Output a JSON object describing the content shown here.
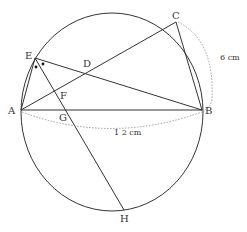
{
  "diagram": {
    "type": "geometry",
    "colors": {
      "stroke": "#333333",
      "dotted": "#777777",
      "background": "#ffffff"
    },
    "circle": {
      "cx": 112,
      "cy": 112,
      "rx": 91,
      "ry": 99
    },
    "points": {
      "A": {
        "label": "A",
        "x": 21,
        "y": 110
      },
      "B": {
        "label": "B",
        "x": 202,
        "y": 110
      },
      "C": {
        "label": "C",
        "x": 176,
        "y": 22
      },
      "D": {
        "label": "D",
        "x": 87,
        "y": 69
      },
      "E": {
        "label": "E",
        "x": 35,
        "y": 58
      },
      "F": {
        "label": "F",
        "x": 63,
        "y": 95
      },
      "G": {
        "label": "G",
        "x": 69,
        "y": 110
      },
      "H": {
        "label": "H",
        "x": 124,
        "y": 210
      }
    },
    "segments": [
      "A-B",
      "A-C",
      "B-C",
      "A-E",
      "E-B",
      "E-H"
    ],
    "measurements": {
      "AB": "1 2 cm",
      "BC": "6 cm"
    },
    "angle_marks": "two equal angles at E (dots) — EH bisects angle AEB"
  }
}
